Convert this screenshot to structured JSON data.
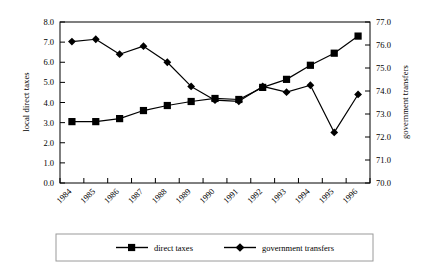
{
  "chart_data": {
    "type": "line",
    "title": "",
    "xlabel": "",
    "categories": [
      "1984",
      "1985",
      "1986",
      "1987",
      "1988",
      "1989",
      "1990",
      "1991",
      "1992",
      "1993",
      "1994",
      "1995",
      "1996"
    ],
    "grid": false,
    "legend_position": "bottom",
    "axes": {
      "left": {
        "label": "local direct taxes",
        "ylim": [
          0.0,
          8.0
        ],
        "step": 1.0,
        "ticks": [
          "0.0",
          "1.0",
          "2.0",
          "3.0",
          "4.0",
          "5.0",
          "6.0",
          "7.0",
          "8.0"
        ]
      },
      "right": {
        "label": "government transfers",
        "ylim": [
          70.0,
          77.0
        ],
        "step": 1.0,
        "ticks": [
          "70.0",
          "71.0",
          "72.0",
          "73.0",
          "74.0",
          "75.0",
          "76.0",
          "77.0"
        ]
      }
    },
    "series": [
      {
        "name": "direct taxes",
        "axis": "left",
        "marker": "square",
        "color": "#000000",
        "values": [
          3.05,
          3.05,
          3.2,
          3.6,
          3.85,
          4.05,
          4.2,
          4.15,
          4.75,
          5.15,
          5.85,
          6.45,
          7.3
        ]
      },
      {
        "name": "government transfers",
        "axis": "right",
        "marker": "diamond",
        "color": "#000000",
        "values": [
          76.15,
          76.25,
          75.6,
          75.95,
          75.25,
          74.2,
          73.6,
          73.55,
          74.2,
          73.95,
          74.25,
          72.2,
          73.85
        ]
      }
    ]
  },
  "legend": {
    "items": [
      {
        "label": "direct taxes",
        "marker": "square"
      },
      {
        "label": "government transfers",
        "marker": "diamond"
      }
    ]
  }
}
